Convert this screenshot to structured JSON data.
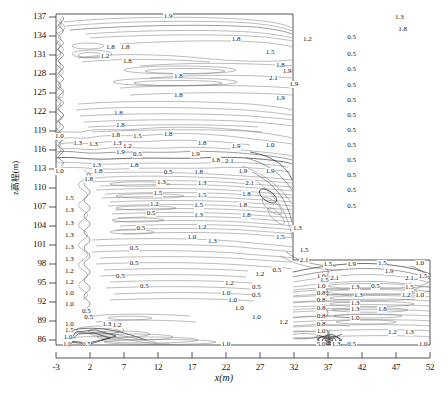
{
  "figure": {
    "kind": "contour-plot",
    "background": "#ffffff",
    "line_color": "#6a6a6a",
    "frame_color": "#2b2b2b"
  },
  "axes": {
    "x_axis_label": "x(m)",
    "y_axis_label": "z高程(m)",
    "x_ticks": [
      "-3",
      "2",
      "7",
      "12",
      "17",
      "22",
      "27",
      "32",
      "37",
      "42",
      "47",
      "52"
    ],
    "y_ticks": [
      "137",
      "134",
      "131",
      "128",
      "125",
      "122",
      "119",
      "116",
      "113",
      "110",
      "107",
      "104",
      "101",
      "98",
      "95",
      "92",
      "89",
      "86"
    ]
  },
  "chart_data": {
    "type": "line",
    "title": "",
    "subtitle": "",
    "xlabel": "x(m)",
    "ylabel": "z高程(m)",
    "xlim": [
      -3,
      52
    ],
    "ylim": [
      86,
      137
    ],
    "xtick_values": [
      -3,
      2,
      7,
      12,
      17,
      22,
      27,
      32,
      37,
      42,
      47,
      52
    ],
    "ytick_values": [
      137,
      134,
      131,
      128,
      125,
      122,
      119,
      116,
      113,
      110,
      107,
      104,
      101,
      98,
      95,
      92,
      89,
      86
    ],
    "grid": false,
    "legend": "none",
    "contour_levels": [
      0.5,
      0.8,
      1.0,
      1.2,
      1.3,
      1.5,
      1.8,
      1.9,
      2.1,
      3.0,
      5.0
    ],
    "inline_labels": [
      {
        "text": "1.9",
        "x": 13.5,
        "y": 136.6
      },
      {
        "text": "1.3",
        "x": 47.5,
        "y": 136.4
      },
      {
        "text": "1.8",
        "x": 48.0,
        "y": 134.6
      },
      {
        "text": "1.8",
        "x": 23.5,
        "y": 133.0
      },
      {
        "text": "1.2",
        "x": 34.0,
        "y": 133.0
      },
      {
        "text": "0.5",
        "x": 40.5,
        "y": 133.4
      },
      {
        "text": "1.8",
        "x": 5.0,
        "y": 131.8
      },
      {
        "text": "1.8",
        "x": 7.2,
        "y": 131.8
      },
      {
        "text": "1.5",
        "x": 28.5,
        "y": 131.0
      },
      {
        "text": "0.5",
        "x": 40.5,
        "y": 130.7
      },
      {
        "text": "1.2",
        "x": 4.2,
        "y": 130.4
      },
      {
        "text": "1.8",
        "x": 7.5,
        "y": 129.7
      },
      {
        "text": "1.8",
        "x": 30.0,
        "y": 129.0
      },
      {
        "text": "1.9",
        "x": 31.0,
        "y": 128.2
      },
      {
        "text": "0.5",
        "x": 40.5,
        "y": 128.4
      },
      {
        "text": "1.8",
        "x": 15.0,
        "y": 127.3
      },
      {
        "text": "2.1",
        "x": 29.0,
        "y": 127.0
      },
      {
        "text": "1.9",
        "x": 32.0,
        "y": 126.2
      },
      {
        "text": "0.5",
        "x": 40.5,
        "y": 126.0
      },
      {
        "text": "1.8",
        "x": 15.0,
        "y": 124.5
      },
      {
        "text": "1.9",
        "x": 30.0,
        "y": 124.0
      },
      {
        "text": "0.5",
        "x": 40.5,
        "y": 123.7
      },
      {
        "text": "0.5",
        "x": 40.5,
        "y": 121.3
      },
      {
        "text": "1.8",
        "x": 6.2,
        "y": 121.6
      },
      {
        "text": "1.8",
        "x": 6.5,
        "y": 119.8
      },
      {
        "text": "0.5",
        "x": 40.5,
        "y": 119.0
      },
      {
        "text": "1.0",
        "x": -2.5,
        "y": 118.2
      },
      {
        "text": "1.8",
        "x": 5.8,
        "y": 118.3
      },
      {
        "text": "1.5",
        "x": 9.0,
        "y": 118.2
      },
      {
        "text": "1.8",
        "x": 13.5,
        "y": 118.5
      },
      {
        "text": "0.5",
        "x": 40.5,
        "y": 116.7
      },
      {
        "text": "1.3",
        "x": 0.2,
        "y": 117.1
      },
      {
        "text": "1.3",
        "x": 2.5,
        "y": 116.9
      },
      {
        "text": "1.3",
        "x": 6.0,
        "y": 117.0
      },
      {
        "text": "1.2",
        "x": 7.5,
        "y": 116.6
      },
      {
        "text": "1.8",
        "x": 18.5,
        "y": 117.0
      },
      {
        "text": "1.9",
        "x": 23.5,
        "y": 116.6
      },
      {
        "text": "1.0",
        "x": 28.5,
        "y": 116.8
      },
      {
        "text": "1.9",
        "x": 6.5,
        "y": 115.6
      },
      {
        "text": "0.5",
        "x": 9.0,
        "y": 115.4
      },
      {
        "text": "1.9",
        "x": 17.5,
        "y": 115.4
      },
      {
        "text": "0.5",
        "x": 40.5,
        "y": 114.4
      },
      {
        "text": "1.8",
        "x": 20.5,
        "y": 114.4
      },
      {
        "text": "2.1",
        "x": 22.5,
        "y": 114.3
      },
      {
        "text": "1.3",
        "x": 3.0,
        "y": 113.6
      },
      {
        "text": "1.8",
        "x": 8.5,
        "y": 113.6
      },
      {
        "text": "1.0",
        "x": -2.5,
        "y": 112.8
      },
      {
        "text": "1.8",
        "x": 3.2,
        "y": 112.8
      },
      {
        "text": "0.5",
        "x": 13.5,
        "y": 112.6
      },
      {
        "text": "1.8",
        "x": 18.0,
        "y": 112.6
      },
      {
        "text": "1.9",
        "x": 24.5,
        "y": 112.8
      },
      {
        "text": "1.9",
        "x": 28.5,
        "y": 112.8
      },
      {
        "text": "0.5",
        "x": 40.5,
        "y": 112.1
      },
      {
        "text": "1.8",
        "x": 1.8,
        "y": 111.5
      },
      {
        "text": "1.3",
        "x": 12.5,
        "y": 111.1
      },
      {
        "text": "1.3",
        "x": 18.5,
        "y": 110.9
      },
      {
        "text": "2.1",
        "x": 25.5,
        "y": 110.9
      },
      {
        "text": "0.5",
        "x": 40.5,
        "y": 109.8
      },
      {
        "text": "1.5",
        "x": 12.0,
        "y": 109.3
      },
      {
        "text": "1.5",
        "x": 18.5,
        "y": 109.0
      },
      {
        "text": "1.8",
        "x": 25.0,
        "y": 109.2
      },
      {
        "text": "1.5",
        "x": -1.0,
        "y": 108.5
      },
      {
        "text": "1.2",
        "x": 11.5,
        "y": 107.6
      },
      {
        "text": "1.5",
        "x": 18.0,
        "y": 107.5
      },
      {
        "text": "1.8",
        "x": 24.5,
        "y": 107.5
      },
      {
        "text": "1.3",
        "x": -1.0,
        "y": 106.7
      },
      {
        "text": "0.5",
        "x": 11.0,
        "y": 106.2
      },
      {
        "text": "1.3",
        "x": 18.0,
        "y": 106.0
      },
      {
        "text": "1.8",
        "x": 25.0,
        "y": 105.9
      },
      {
        "text": "0.5",
        "x": 40.5,
        "y": 107.4
      },
      {
        "text": "1.3",
        "x": -1.0,
        "y": 104.7
      },
      {
        "text": "0.5",
        "x": 9.5,
        "y": 104.0
      },
      {
        "text": "1.2",
        "x": 18.5,
        "y": 104.1
      },
      {
        "text": "1.3",
        "x": -1.0,
        "y": 102.9
      },
      {
        "text": "1.0",
        "x": 17.0,
        "y": 102.6
      },
      {
        "text": "1.3",
        "x": 20.0,
        "y": 102.0
      },
      {
        "text": "1.3",
        "x": -1.0,
        "y": 101.0
      },
      {
        "text": "0.5",
        "x": 8.5,
        "y": 100.8
      },
      {
        "text": "1.3",
        "x": -1.0,
        "y": 99.2
      },
      {
        "text": "0.5",
        "x": 8.5,
        "y": 98.6
      },
      {
        "text": "1.2",
        "x": -1.0,
        "y": 97.3
      },
      {
        "text": "0.5",
        "x": 6.5,
        "y": 96.6
      },
      {
        "text": "1.2",
        "x": -1.0,
        "y": 95.6
      },
      {
        "text": "0.5",
        "x": 10.0,
        "y": 95.0
      },
      {
        "text": "1.0",
        "x": -1.0,
        "y": 93.9
      },
      {
        "text": "1.0",
        "x": -1.0,
        "y": 92.2
      },
      {
        "text": "0.5",
        "x": 1.5,
        "y": 91.1
      },
      {
        "text": "0.5",
        "x": 1.8,
        "y": 90.2
      },
      {
        "text": "1.0",
        "x": -1.0,
        "y": 89.2
      },
      {
        "text": "1.3",
        "x": 4.5,
        "y": 89.2
      },
      {
        "text": "1.2",
        "x": 6.0,
        "y": 89.0
      },
      {
        "text": "1.5",
        "x": -1.0,
        "y": 88.3
      },
      {
        "text": "1.0",
        "x": -1.2,
        "y": 87.2
      },
      {
        "text": "1.0",
        "x": -1.3,
        "y": 86.1
      },
      {
        "text": "0.5",
        "x": 1.5,
        "y": 86.1
      },
      {
        "text": "1.3",
        "x": 32.5,
        "y": 104.0
      },
      {
        "text": "1.5",
        "x": 30.0,
        "y": 102.6
      },
      {
        "text": "1.5",
        "x": 33.5,
        "y": 100.5
      },
      {
        "text": "2.1",
        "x": 33.5,
        "y": 99.0
      },
      {
        "text": "1.5",
        "x": 37.0,
        "y": 98.4
      },
      {
        "text": "1.9",
        "x": 40.5,
        "y": 98.4
      },
      {
        "text": "1.5",
        "x": 45.0,
        "y": 98.6
      },
      {
        "text": "1.0",
        "x": 50.5,
        "y": 98.6
      },
      {
        "text": "0.5",
        "x": 29.5,
        "y": 97.5
      },
      {
        "text": "1.9",
        "x": 46.0,
        "y": 97.3
      },
      {
        "text": "2.1",
        "x": 49.0,
        "y": 96.2
      },
      {
        "text": "1.5",
        "x": 51.0,
        "y": 96.6
      },
      {
        "text": "1.2",
        "x": 27.0,
        "y": 96.9
      },
      {
        "text": "1.0",
        "x": 36.0,
        "y": 96.6
      },
      {
        "text": "2.1",
        "x": 38.0,
        "y": 96.3
      },
      {
        "text": "1.5",
        "x": 36.5,
        "y": 95.9
      },
      {
        "text": "1.2",
        "x": 22.5,
        "y": 95.5
      },
      {
        "text": "0.5",
        "x": 26.5,
        "y": 94.9
      },
      {
        "text": "1.0",
        "x": 36.0,
        "y": 95.0
      },
      {
        "text": "1.3",
        "x": 41.0,
        "y": 94.8
      },
      {
        "text": "0.5",
        "x": 44.0,
        "y": 95.0
      },
      {
        "text": "1.5",
        "x": 49.0,
        "y": 94.8
      },
      {
        "text": "1.0",
        "x": 22.0,
        "y": 93.9
      },
      {
        "text": "0.5",
        "x": 26.5,
        "y": 93.7
      },
      {
        "text": "0.8",
        "x": 36.0,
        "y": 94.0
      },
      {
        "text": "1.3",
        "x": 41.5,
        "y": 93.6
      },
      {
        "text": "1.2",
        "x": 48.5,
        "y": 93.6
      },
      {
        "text": "1.0",
        "x": 50.5,
        "y": 93.6
      },
      {
        "text": "1.0",
        "x": 23.0,
        "y": 92.8
      },
      {
        "text": "0.8",
        "x": 36.0,
        "y": 92.9
      },
      {
        "text": "1.3",
        "x": 41.0,
        "y": 92.4
      },
      {
        "text": "1.0",
        "x": 24.0,
        "y": 91.6
      },
      {
        "text": "0.8",
        "x": 36.0,
        "y": 91.7
      },
      {
        "text": "1.3",
        "x": 41.0,
        "y": 91.4
      },
      {
        "text": "1.8",
        "x": 45.0,
        "y": 91.4
      },
      {
        "text": "1.0",
        "x": 26.5,
        "y": 90.3
      },
      {
        "text": "0.8",
        "x": 36.0,
        "y": 90.4
      },
      {
        "text": "1.0",
        "x": 41.0,
        "y": 90.1
      },
      {
        "text": "1.2",
        "x": 30.5,
        "y": 89.4
      },
      {
        "text": "0.8",
        "x": 36.0,
        "y": 89.2
      },
      {
        "text": "1.0",
        "x": 36.0,
        "y": 88.1
      },
      {
        "text": "1.2",
        "x": 46.5,
        "y": 88.0
      },
      {
        "text": "1.3",
        "x": 49.0,
        "y": 88.0
      },
      {
        "text": "1.0",
        "x": 22.0,
        "y": 86.1
      },
      {
        "text": "5.0",
        "x": 36.0,
        "y": 86.1
      },
      {
        "text": "1.3",
        "x": 38.2,
        "y": 86.1
      },
      {
        "text": "0.5",
        "x": 40.5,
        "y": 86.1
      },
      {
        "text": "1.0",
        "x": 51.0,
        "y": 86.1
      }
    ]
  }
}
